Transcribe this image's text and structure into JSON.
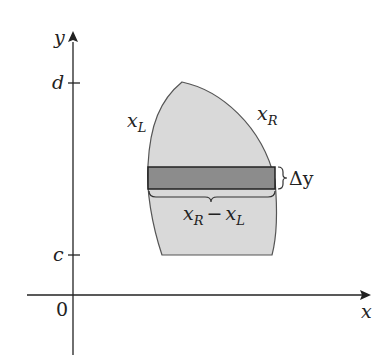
{
  "figure": {
    "axes": {
      "x_label": "x",
      "y_label": "y",
      "origin_label": "0",
      "y_ticks": [
        {
          "label": "d"
        },
        {
          "label": "c"
        }
      ]
    },
    "region": {
      "left_boundary_label": "x",
      "left_boundary_sub": "L",
      "right_boundary_label": "x",
      "right_boundary_sub": "R",
      "fill_color": "#d9d9d9",
      "strip_color": "#8c8c8c"
    },
    "strip": {
      "height_label": "Δy",
      "width_label_a": "x",
      "width_sub_a": "R",
      "width_minus": "−",
      "width_label_b": "x",
      "width_sub_b": "L"
    }
  }
}
